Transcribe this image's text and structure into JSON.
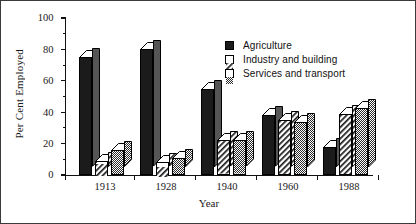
{
  "chart_data": {
    "type": "bar",
    "title": "",
    "subtitle": "",
    "xlabel": "Year",
    "ylabel": "Per Cent Employed",
    "categories": [
      "1913",
      "1928",
      "1940",
      "1960",
      "1988"
    ],
    "series": [
      {
        "name": "Agriculture",
        "key": "agri",
        "values": [
          75,
          80,
          55,
          38,
          18
        ]
      },
      {
        "name": "Industry and building",
        "key": "ind",
        "values": [
          9,
          8,
          22,
          35,
          39
        ]
      },
      {
        "name": "Services and transport",
        "key": "serv",
        "values": [
          16,
          11,
          22,
          34,
          43
        ]
      }
    ],
    "ylim": [
      0,
      100
    ],
    "ytick_major": [
      0,
      20,
      40,
      60,
      80,
      100
    ],
    "ytick_minor": [
      10,
      30,
      50,
      70,
      90
    ],
    "grid": false,
    "legend_position": "upper right",
    "style": "3d-extruded-bars"
  },
  "axes": {
    "y_title": "Per Cent Employed",
    "x_title": "Year",
    "y_tick_labels": [
      "0",
      "20",
      "40",
      "60",
      "80",
      "100"
    ],
    "x_tick_labels": [
      "1913",
      "1928",
      "1940",
      "1960",
      "1988"
    ]
  },
  "legend": {
    "items": [
      {
        "label": "Agriculture",
        "swatch": "solid-black-swatch"
      },
      {
        "label": "Industry and building",
        "swatch": "diagonal-hatch-swatch"
      },
      {
        "label": "Services and transport",
        "swatch": "checkered-gray-swatch"
      }
    ]
  },
  "colors": {
    "agriculture": "#1b1b1b",
    "industry": "#ffffff",
    "services": "#8e8e8e",
    "outline": "#000000",
    "axis": "#111111",
    "frame": "#3a3a3a",
    "background": "#ffffff"
  }
}
